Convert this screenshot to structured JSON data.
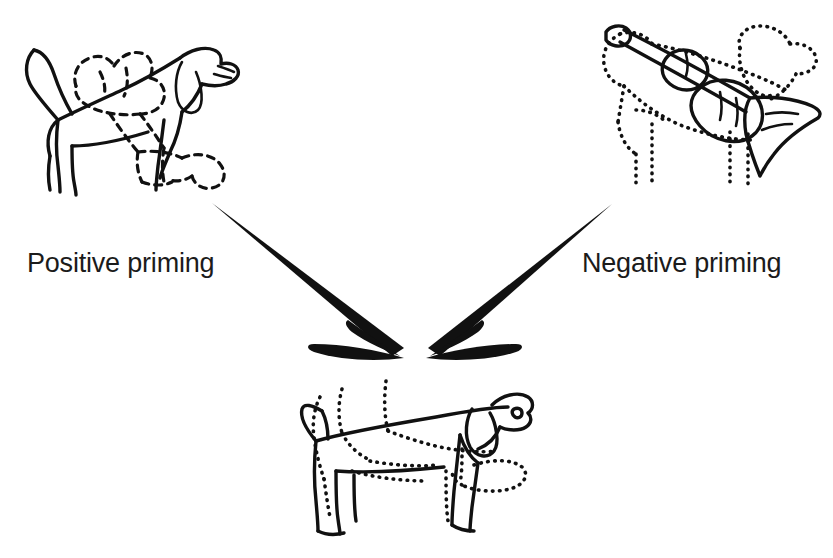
{
  "figure": {
    "background_color": "#ffffff",
    "ink_color": "#111111",
    "width": 833,
    "height": 558,
    "labels": {
      "positive": "Positive priming",
      "negative": "Negative priming"
    },
    "stimuli": [
      {
        "id": "prime-positive",
        "role": "prime",
        "position": "top-left",
        "description": "overlapping line drawings: solid-outline dog with a dashed-outline dog superimposed"
      },
      {
        "id": "prime-negative",
        "role": "prime",
        "position": "top-right",
        "description": "overlapping line drawings: dotted-outline dog with a solid-outline trumpet superimposed"
      },
      {
        "id": "target-dog",
        "role": "target",
        "position": "bottom-center",
        "description": "line drawing of a dog in solid and dotted outline"
      }
    ],
    "arrows": [
      {
        "id": "arrow-positive",
        "from": "prime-positive",
        "to": "target-dog",
        "direction": "down-right"
      },
      {
        "id": "arrow-negative",
        "from": "prime-negative",
        "to": "target-dog",
        "direction": "down-left"
      }
    ]
  }
}
